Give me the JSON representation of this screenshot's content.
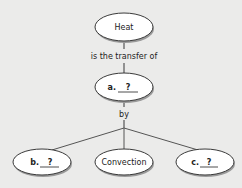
{
  "diagram": {
    "type": "concept-map",
    "nodes": {
      "root": {
        "label": "Heat"
      },
      "a": {
        "prefix": "a.",
        "blank": "?"
      },
      "b": {
        "prefix": "b.",
        "blank": "?"
      },
      "convection": {
        "label": "Convection"
      },
      "c": {
        "prefix": "c.",
        "blank": "?"
      }
    },
    "links": {
      "root_to_a": "is the transfer of",
      "a_to_children": "by"
    },
    "colors": {
      "background": "#ebebea",
      "node_fill": "#ffffff",
      "node_stroke": "#3a3a3a",
      "node_shadow": "#9a9a9a",
      "line": "#555555"
    }
  }
}
